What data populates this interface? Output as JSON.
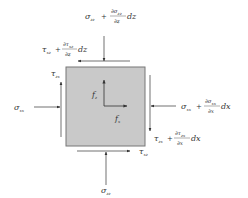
{
  "diagram": {
    "element": {
      "fill": "#c9c9c9",
      "stroke": "#777777"
    },
    "body_forces": {
      "fz": {
        "symbol": "f",
        "sub": "z"
      },
      "fx": {
        "symbol": "f",
        "sub": "x"
      }
    },
    "labels": {
      "top_normal": {
        "base": "σ",
        "sub": "zz",
        "plus": "+",
        "num": "∂σ",
        "num_sub": "zz",
        "den": "∂z",
        "tail": "dz"
      },
      "top_shear": {
        "base": "τ",
        "sub": "xz",
        "plus": "+",
        "num": "∂τ",
        "num_sub": "xz",
        "den": "∂z",
        "tail": "dz"
      },
      "left_normal": {
        "base": "σ",
        "sub": "xx"
      },
      "left_shear": {
        "base": "τ",
        "sub": "zx"
      },
      "right_normal": {
        "base": "σ",
        "sub": "xx",
        "plus": "+",
        "num": "∂σ",
        "num_sub": "xx",
        "den": "∂x",
        "tail": "dx"
      },
      "right_shear": {
        "base": "τ",
        "sub": "zx",
        "plus": "+",
        "num": "∂τ",
        "num_sub": "zx",
        "den": "∂x",
        "tail": "dx"
      },
      "bottom_shear": {
        "base": "τ",
        "sub": "xz"
      },
      "bottom_normal": {
        "base": "σ",
        "sub": "zz"
      }
    }
  }
}
